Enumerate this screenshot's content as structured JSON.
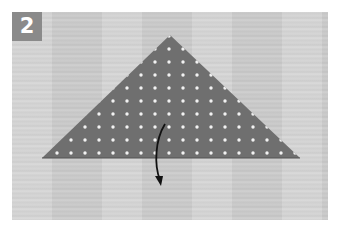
{
  "step": {
    "number": "2"
  },
  "figure": {
    "paper_color": "#6f6f6f",
    "dot_color": "#f2f2f2",
    "arrow_color": "#111111",
    "icons": [
      "fold-arrow-icon"
    ]
  }
}
